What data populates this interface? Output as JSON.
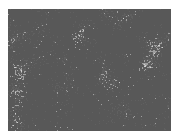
{
  "image": {
    "description": "Grayscale micrograph of granular particles with dark voids",
    "alt": "grainy grayscale particle texture",
    "colors": {
      "light": "#e6e6e6",
      "mid": "#a0a0a0",
      "dark": "#1e1e1e",
      "background": "#ffffff"
    }
  }
}
